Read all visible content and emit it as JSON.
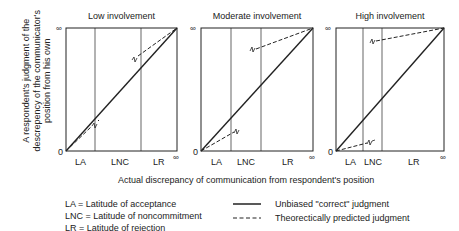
{
  "figure": {
    "y_axis_label": "A respondent's judgment of the descrepency of the communicator's position from his own",
    "x_axis_label": "Actual discrepancy of communication from respondent's position",
    "origin_label": "0",
    "infinity_label": "∞",
    "panels": [
      {
        "title": "Low involvement",
        "zones": [
          "LA",
          "LNC",
          "LR"
        ]
      },
      {
        "title": "Moderate involvement",
        "zones": [
          "LA",
          "LNC",
          "LR"
        ]
      },
      {
        "title": "High involvement",
        "zones": [
          "LA",
          "LNC",
          "LR"
        ]
      }
    ],
    "legend": {
      "abbreviations": [
        "LA = Latitude of acceptance",
        "LNC = Latitude of noncommitment",
        "LR = Latitude of rejection"
      ],
      "solid_line": "Unbiased \"correct\" judgment",
      "dashed_line": "Theorectically predicted judgment"
    }
  }
}
